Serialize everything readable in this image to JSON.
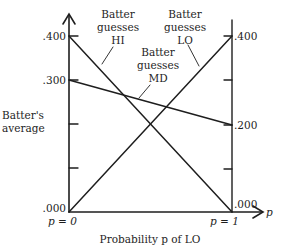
{
  "diagram": {
    "y_axis_title": [
      "Batter's",
      "average"
    ],
    "x_axis_title": "Probability p of LO",
    "x_axis_var": "p",
    "left_axis": {
      "label_p": "p = 0",
      "ticks": [
        ".400",
        ".300",
        ".000"
      ]
    },
    "right_axis": {
      "label_p": "p = 1",
      "ticks": [
        ".400",
        ".200",
        ".000"
      ]
    },
    "lines": [
      {
        "name": "Batter guesses HI",
        "label": [
          "Batter",
          "guesses",
          "HI"
        ],
        "start": 0.4,
        "end": 0.0
      },
      {
        "name": "Batter guesses MD",
        "label": [
          "Batter",
          "guesses",
          "MD"
        ],
        "start": 0.3,
        "end": 0.2
      },
      {
        "name": "Batter guesses LO",
        "label": [
          "Batter",
          "guesses",
          "LO"
        ],
        "start": 0.0,
        "end": 0.4
      }
    ],
    "colors": {
      "ink": "#1e1e1e",
      "background": "#ffffff"
    }
  }
}
